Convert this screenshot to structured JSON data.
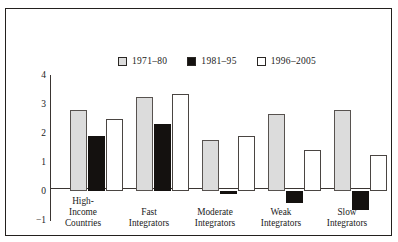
{
  "chart_data": {
    "type": "bar",
    "title": "",
    "xlabel": "",
    "ylabel": "Percent",
    "ylim": [
      -1,
      4
    ],
    "yticks": [
      "4",
      "3",
      "2",
      "1",
      "0",
      "-1"
    ],
    "ytick_values": [
      4,
      3,
      2,
      1,
      0,
      -1
    ],
    "grid": false,
    "legend_position": "top-center",
    "categories": [
      "High-\nIncome\nCountries",
      "Fast\nIntegrators",
      "Moderate\nIntegrators",
      "Weak\nIntegrators",
      "Slow\nIntegrators"
    ],
    "category_lines": [
      [
        "High-",
        "Income",
        "Countries"
      ],
      [
        "Fast",
        "Integrators"
      ],
      [
        "Moderate",
        "Integrators"
      ],
      [
        "Weak",
        "Integrators"
      ],
      [
        "Slow",
        "Integrators"
      ]
    ],
    "series": [
      {
        "name": "1971–80",
        "color": "#dcdcdc",
        "values": [
          2.8,
          3.25,
          1.75,
          2.65,
          2.8
        ]
      },
      {
        "name": "1981–95",
        "color": "#14110f",
        "values": [
          1.9,
          2.3,
          -0.1,
          -0.4,
          -0.65
        ]
      },
      {
        "name": "1996–2005",
        "color": "#ffffff",
        "values": [
          2.5,
          3.35,
          1.9,
          1.4,
          1.25
        ]
      }
    ]
  },
  "legend": {
    "entries": [
      {
        "label": "1971–80",
        "swatch": "gray-swatch-icon"
      },
      {
        "label": "1981–95",
        "swatch": "black-swatch-icon"
      },
      {
        "label": "1996–2005",
        "swatch": "white-swatch-icon"
      }
    ]
  },
  "axis": {
    "y_title": "Percent",
    "y_ticks": [
      "4",
      "3",
      "2",
      "1",
      "0",
      "−1"
    ]
  },
  "categories": [
    {
      "line1": "High-",
      "line2": "Income",
      "line3": "Countries"
    },
    {
      "line1": "Fast",
      "line2": "Integrators",
      "line3": ""
    },
    {
      "line1": "Moderate",
      "line2": "Integrators",
      "line3": ""
    },
    {
      "line1": "Weak",
      "line2": "Integrators",
      "line3": ""
    },
    {
      "line1": "Slow",
      "line2": "Integrators",
      "line3": ""
    }
  ],
  "colors": {
    "series_1971_80": "#dcdcdc",
    "series_1981_95": "#14110f",
    "series_1996_2005": "#ffffff",
    "frame": "#23201e",
    "axis": "#3a3532",
    "text": "#1a1a1a",
    "background": "#ffffff"
  }
}
